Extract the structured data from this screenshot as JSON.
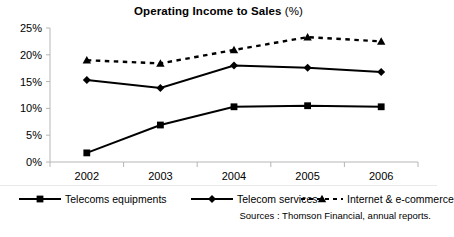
{
  "chart_data": {
    "type": "line",
    "title": "Operating Income to Sales",
    "title_suffix": "(%)",
    "xlabel": "",
    "ylabel": "",
    "categories": [
      "2002",
      "2003",
      "2004",
      "2005",
      "2006"
    ],
    "ylim": [
      0,
      25
    ],
    "ytick_labels": [
      "0%",
      "5%",
      "10%",
      "15%",
      "20%",
      "25%"
    ],
    "ytick_values": [
      0,
      5,
      10,
      15,
      20,
      25
    ],
    "grid": false,
    "legend_position": "bottom",
    "series": [
      {
        "name": "Telecoms equipments",
        "marker": "square",
        "line_style": "solid",
        "color": "#000000",
        "values": [
          1.7,
          6.9,
          10.3,
          10.5,
          10.3
        ]
      },
      {
        "name": "Telecom services",
        "marker": "diamond",
        "line_style": "solid",
        "color": "#000000",
        "values": [
          15.3,
          13.8,
          18.0,
          17.6,
          16.8
        ]
      },
      {
        "name": "Internet & e-commerce",
        "marker": "triangle",
        "line_style": "dashed",
        "color": "#000000",
        "values": [
          19.0,
          18.4,
          20.9,
          23.3,
          22.5
        ]
      }
    ],
    "annotations": {
      "sources": "Sources : Thomson Financial, annual reports."
    }
  },
  "legend": {
    "items": [
      {
        "label": "Telecoms equipments",
        "marker": "square",
        "style": "solid"
      },
      {
        "label": "Telecom services",
        "marker": "diamond",
        "style": "solid"
      },
      {
        "label": "Internet & e-commerce",
        "marker": "triangle",
        "style": "dashed"
      }
    ]
  }
}
